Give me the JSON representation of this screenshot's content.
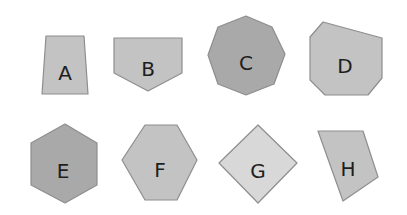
{
  "colors": {
    "background": "#ffffff",
    "dark_fill": "#a9a9a9",
    "medium_fill": "#c3c3c3",
    "light_fill": "#d8d8d8",
    "stroke": "#8e8e8e",
    "label": "#1e1e1e"
  },
  "shapes": [
    {
      "label": "A",
      "type": "quadrilateral",
      "fill": "medium",
      "points": "46,36 84,36 88,94 42,94",
      "label_pos": [
        65,
        73
      ]
    },
    {
      "label": "B",
      "type": "pentagon",
      "fill": "medium",
      "points": "114,38 182,38 182,73 148,91 114,73",
      "label_pos": [
        148,
        69
      ]
    },
    {
      "label": "C",
      "type": "octagon",
      "fill": "dark",
      "points": "246,16 272,27 285,54 274,84 246,95 218,84 208,55 218,27",
      "label_pos": [
        246,
        63
      ]
    },
    {
      "label": "D",
      "type": "heptagon",
      "fill": "medium",
      "points": "323,22 382,38 382,78 368,95 325,95 310,80 310,37",
      "label_pos": [
        345,
        66
      ]
    },
    {
      "label": "E",
      "type": "hexagon",
      "fill": "dark",
      "points": "65,124 97,143 97,185 65,203 31,185 31,143",
      "label_pos": [
        63,
        171
      ]
    },
    {
      "label": "F",
      "type": "hexagon",
      "fill": "medium",
      "points": "145,125 177,125 197,160 177,200 145,200 122,160",
      "label_pos": [
        160,
        170
      ]
    },
    {
      "label": "G",
      "type": "rhombus",
      "fill": "light",
      "points": "258,125 297,163 258,203 219,163",
      "label_pos": [
        258,
        171
      ]
    },
    {
      "label": "H",
      "type": "quadrilateral",
      "fill": "medium",
      "points": "318,131 363,131 378,177 343,201",
      "label_pos": [
        348,
        169
      ]
    }
  ]
}
